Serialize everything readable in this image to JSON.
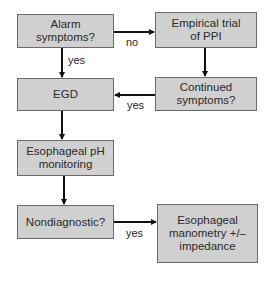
{
  "diagram": {
    "nodes": [
      {
        "id": "alarm",
        "label": "Alarm\nsymptoms?"
      },
      {
        "id": "empirical",
        "label": "Empirical trial\nof PPI"
      },
      {
        "id": "egd",
        "label": "EGD"
      },
      {
        "id": "continued",
        "label": "Continued\nsymptoms?"
      },
      {
        "id": "ph",
        "label": "Esophageal pH\nmonitoring"
      },
      {
        "id": "nondiag",
        "label": "Nondiagnostic?"
      },
      {
        "id": "manometry",
        "label": "Esophageal\nmanometry +/–\nimpedance"
      }
    ],
    "edges": [
      {
        "from": "alarm",
        "to": "empirical",
        "label": "no"
      },
      {
        "from": "alarm",
        "to": "egd",
        "label": "yes"
      },
      {
        "from": "empirical",
        "to": "continued",
        "label": ""
      },
      {
        "from": "continued",
        "to": "egd",
        "label": "yes"
      },
      {
        "from": "egd",
        "to": "ph",
        "label": ""
      },
      {
        "from": "ph",
        "to": "nondiag",
        "label": ""
      },
      {
        "from": "nondiag",
        "to": "manometry",
        "label": "yes"
      }
    ]
  },
  "colors": {
    "box_fill": "#d0d0d0",
    "box_border": "#6a6a6a",
    "arrow": "#111111"
  }
}
